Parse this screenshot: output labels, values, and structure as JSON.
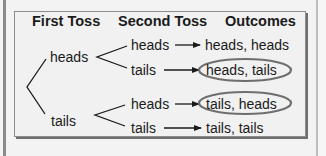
{
  "diagram": {
    "type": "probability-tree",
    "headers": {
      "first_toss": "First Toss",
      "second_toss": "Second Toss",
      "outcomes": "Outcomes"
    },
    "first_toss": [
      {
        "label": "heads",
        "second_toss": [
          {
            "label": "heads",
            "outcome": "heads, heads",
            "circled": false
          },
          {
            "label": "tails",
            "outcome": "heads, tails",
            "circled": true
          }
        ]
      },
      {
        "label": "tails",
        "second_toss": [
          {
            "label": "heads",
            "outcome": "tails, heads",
            "circled": true
          },
          {
            "label": "tails",
            "outcome": "tails, tails",
            "circled": false
          }
        ]
      }
    ],
    "colors": {
      "line": "#1a1a1a",
      "circle": "#6e6e6e",
      "frame_shadow": "#6e6e6e",
      "background": "#f1f1f1"
    }
  }
}
